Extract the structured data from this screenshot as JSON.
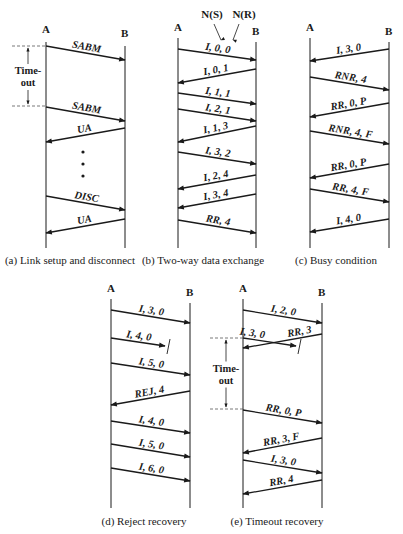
{
  "colors": {
    "ink": "#1a1a1a",
    "dash": "#555555",
    "background": "#ffffff"
  },
  "diagrams": [
    {
      "id": "a",
      "caption": "(a) Link setup and disconnect",
      "caption_x": 70,
      "caption_y": 264,
      "a_x": 46,
      "b_x": 125,
      "top": 42,
      "bottom": 248,
      "label_y": 33,
      "timeout": {
        "label1": "Time-",
        "label2": "out",
        "y1": 46,
        "y2": 106,
        "arrow_x": 28,
        "dash_x1": 12
      },
      "dots": [
        {
          "x": 83,
          "y": 152
        },
        {
          "x": 83,
          "y": 164
        },
        {
          "x": 83,
          "y": 176
        }
      ],
      "messages": [
        {
          "label": "SABM",
          "from": "A",
          "y1": 46,
          "y2": 60,
          "lost": false
        },
        {
          "label": "SABM",
          "from": "A",
          "y1": 107,
          "y2": 121,
          "lost": false
        },
        {
          "label": "UA",
          "from": "B",
          "y1": 128,
          "y2": 142,
          "lost": false
        },
        {
          "label": "DISC",
          "from": "A",
          "y1": 196,
          "y2": 210,
          "lost": false
        },
        {
          "label": "UA",
          "from": "B",
          "y1": 219,
          "y2": 233,
          "lost": false
        }
      ]
    },
    {
      "id": "b",
      "caption": "(b) Two-way data exchange",
      "caption_x": 203,
      "caption_y": 264,
      "a_x": 178,
      "b_x": 256,
      "top": 38,
      "bottom": 248,
      "label_y": 31,
      "annotations": [
        {
          "label": "N(S)",
          "x": 212,
          "y": 18,
          "arrow_from": [
            214,
            24
          ],
          "arrow_to": [
            221,
            40
          ]
        },
        {
          "label": "N(R)",
          "x": 244,
          "y": 18,
          "arrow_from": [
            239,
            24
          ],
          "arrow_to": [
            233,
            40
          ]
        }
      ],
      "messages": [
        {
          "label": "I, 0, 0",
          "from": "A",
          "y1": 49,
          "y2": 60,
          "lost": false
        },
        {
          "label": "I, 0, 1",
          "from": "B",
          "y1": 69,
          "y2": 83,
          "lost": false
        },
        {
          "label": "I, 1, 1",
          "from": "A",
          "y1": 93,
          "y2": 104,
          "lost": false
        },
        {
          "label": "I, 2, 1",
          "from": "A",
          "y1": 109,
          "y2": 121,
          "lost": false
        },
        {
          "label": "I, 1, 3",
          "from": "B",
          "y1": 126,
          "y2": 142,
          "lost": false
        },
        {
          "label": "I, 3, 2",
          "from": "A",
          "y1": 152,
          "y2": 164,
          "lost": false
        },
        {
          "label": "I, 2, 4",
          "from": "B",
          "y1": 175,
          "y2": 189,
          "lost": false
        },
        {
          "label": "I, 3, 4",
          "from": "B",
          "y1": 194,
          "y2": 208,
          "lost": false
        },
        {
          "label": "RR, 4",
          "from": "A",
          "y1": 220,
          "y2": 233,
          "lost": false
        }
      ]
    },
    {
      "id": "c",
      "caption": "(c) Busy condition",
      "caption_x": 336,
      "caption_y": 264,
      "a_x": 310,
      "b_x": 389,
      "top": 38,
      "bottom": 248,
      "label_y": 31,
      "messages": [
        {
          "label": "I, 3, 0",
          "from": "B",
          "y1": 49,
          "y2": 61,
          "lost": false
        },
        {
          "label": "RNR, 4",
          "from": "A",
          "y1": 77,
          "y2": 90,
          "lost": false
        },
        {
          "label": "RR, 0, P",
          "from": "B",
          "y1": 103,
          "y2": 117,
          "lost": false
        },
        {
          "label": "RNR, 4, F",
          "from": "A",
          "y1": 131,
          "y2": 144,
          "lost": false
        },
        {
          "label": "RR, 0, P",
          "from": "B",
          "y1": 164,
          "y2": 178,
          "lost": false
        },
        {
          "label": "RR, 4, F",
          "from": "A",
          "y1": 189,
          "y2": 202,
          "lost": false
        },
        {
          "label": "I, 4, 0",
          "from": "B",
          "y1": 219,
          "y2": 232,
          "lost": false
        }
      ]
    },
    {
      "id": "d",
      "caption": "(d) Reject recovery",
      "caption_x": 144,
      "caption_y": 525,
      "a_x": 111,
      "b_x": 190,
      "top": 299,
      "bottom": 508,
      "label_y": 292,
      "messages": [
        {
          "label": "I, 3, 0",
          "from": "A",
          "y1": 310,
          "y2": 323,
          "lost": false
        },
        {
          "label": "I, 4, 0",
          "from": "A",
          "y1": 338,
          "y2": 346,
          "lost": true,
          "lost_x": 165
        },
        {
          "label": "I, 5, 0",
          "from": "A",
          "y1": 363,
          "y2": 375,
          "lost": false
        },
        {
          "label": "REJ, 4",
          "from": "B",
          "y1": 391,
          "y2": 405,
          "lost": false
        },
        {
          "label": "I, 4, 0",
          "from": "A",
          "y1": 421,
          "y2": 433,
          "lost": false
        },
        {
          "label": "I, 5, 0",
          "from": "A",
          "y1": 444,
          "y2": 457,
          "lost": false
        },
        {
          "label": "I, 6, 0",
          "from": "A",
          "y1": 468,
          "y2": 481,
          "lost": false
        }
      ]
    },
    {
      "id": "e",
      "caption": "(e) Timeout recovery",
      "caption_x": 277,
      "caption_y": 525,
      "a_x": 243,
      "b_x": 322,
      "top": 299,
      "bottom": 508,
      "label_y": 292,
      "timeout": {
        "label1": "Time-",
        "label2": "out",
        "y1": 338,
        "y2": 409,
        "arrow_x": 226,
        "dash_x1": 210
      },
      "messages": [
        {
          "label": "I, 2, 0",
          "from": "A",
          "y1": 310,
          "y2": 323,
          "lost": false
        },
        {
          "label": "I, 3, 0",
          "from": "A",
          "y1": 338,
          "y2": 346,
          "lost": true,
          "lost_x": 296,
          "label_dx": -18
        },
        {
          "label": "RR, 3",
          "from": "B",
          "y1": 334,
          "y2": 348,
          "lost": false,
          "label_dx": 18
        },
        {
          "label": "RR, 0, P",
          "from": "A",
          "y1": 410,
          "y2": 423,
          "lost": false
        },
        {
          "label": "RR, 3, F",
          "from": "B",
          "y1": 438,
          "y2": 453,
          "lost": false
        },
        {
          "label": "I, 3, 0",
          "from": "A",
          "y1": 460,
          "y2": 473,
          "lost": false
        },
        {
          "label": "RR, 4",
          "from": "B",
          "y1": 480,
          "y2": 494,
          "lost": false
        }
      ]
    }
  ],
  "node_labels": {
    "a": "A",
    "b": "B"
  }
}
